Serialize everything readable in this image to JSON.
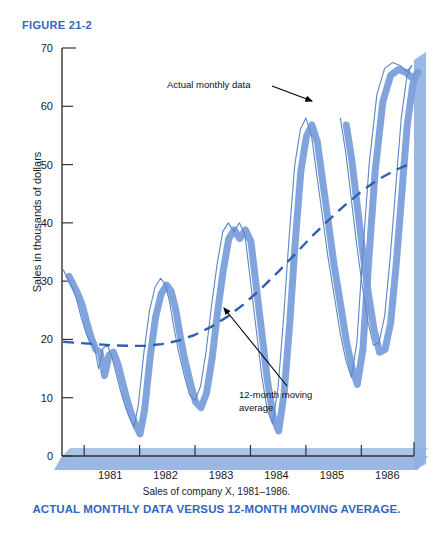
{
  "figure": {
    "label": "FIGURE 21-2"
  },
  "caption": {
    "source_note": "Sales of company X, 1981–1986.",
    "title": "ACTUAL MONTHLY DATA VERSUS 12-MONTH MOVING AVERAGE."
  },
  "colors": {
    "accent_blue": "#2f68c0",
    "shadow_blue": "#7b9fdb",
    "line_blue": "#5a86c8",
    "axis": "#333333"
  },
  "chart_data": {
    "type": "line",
    "title": "ACTUAL MONTHLY DATA VERSUS 12-MONTH MOVING AVERAGE.",
    "subtitle": "Sales of company X, 1981–1986.",
    "xlabel": "",
    "ylabel": "Sales in thousands of dollars",
    "ylim": [
      0,
      70
    ],
    "yticks": [
      0,
      10,
      20,
      30,
      40,
      50,
      60,
      70
    ],
    "xlim": [
      1980.6,
      1986.95
    ],
    "xticks": [
      1981,
      1982,
      1983,
      1984,
      1985,
      1986
    ],
    "xtick_labels": [
      "1981",
      "1982",
      "1983",
      "1984",
      "1985",
      "1986"
    ],
    "grid": false,
    "legend": "none",
    "annotations": [
      {
        "text": "Actual monthly data",
        "target_series": "actual_monthly_data"
      },
      {
        "text": "12-month moving average",
        "target_series": "moving_average_12mo"
      }
    ],
    "series": [
      {
        "name": "actual_monthly_data",
        "label": "Actual monthly data",
        "style": "solid-thin-with-shadow",
        "x": [
          1980.62,
          1980.7,
          1980.78,
          1980.86,
          1980.94,
          1981.02,
          1981.1,
          1981.18,
          1981.26,
          1981.34,
          1981.42,
          1981.5,
          1981.58,
          1981.66,
          1981.74,
          1981.82,
          1981.9,
          1981.98,
          1982.08,
          1982.18,
          1982.28,
          1982.38,
          1982.46,
          1982.54,
          1982.62,
          1982.7,
          1982.8,
          1982.9,
          1983.0,
          1983.1,
          1983.2,
          1983.3,
          1983.4,
          1983.5,
          1983.6,
          1983.7,
          1983.8,
          1983.9,
          1984.0,
          1984.1,
          1984.2,
          1984.3,
          1984.4,
          1984.5,
          1984.6,
          1984.7,
          1984.8,
          1984.9,
          1985.0,
          1985.1,
          1985.2,
          1985.3,
          1985.4,
          1985.52,
          1985.62,
          1985.72,
          1985.82,
          1985.92,
          1986.02,
          1986.14,
          1986.28,
          1986.42,
          1986.56,
          1986.7,
          1986.82,
          1986.92
        ],
        "y": [
          32.0,
          30.5,
          29.0,
          27.0,
          24.0,
          21.5,
          19.5,
          19.0,
          15.0,
          18.5,
          19.0,
          17.0,
          14.0,
          11.0,
          8.5,
          6.5,
          5.0,
          9.0,
          18.0,
          25.0,
          29.0,
          30.5,
          29.5,
          26.5,
          22.0,
          18.0,
          14.0,
          10.5,
          9.5,
          12.0,
          18.0,
          26.0,
          33.0,
          38.5,
          40.0,
          38.5,
          40.0,
          38.0,
          30.0,
          22.0,
          14.0,
          8.0,
          5.5,
          12.0,
          24.0,
          38.0,
          50.0,
          56.0,
          58.0,
          55.0,
          48.0,
          41.0,
          34.0,
          27.0,
          21.0,
          16.5,
          13.5,
          19.5,
          34.0,
          50.0,
          62.0,
          66.5,
          67.5,
          67.0,
          66.0,
          67.0
        ]
      },
      {
        "name": "actual_monthly_data_tail",
        "label": "Actual monthly data (1985-86 cycle)",
        "style": "solid-thin-with-shadow",
        "x": [
          1985.62,
          1985.72,
          1985.82,
          1985.92,
          1986.02,
          1986.12,
          1986.22,
          1986.32,
          1986.42,
          1986.52,
          1986.62,
          1986.72,
          1986.82,
          1986.9
        ],
        "y": [
          58.0,
          52.0,
          44.0,
          36.0,
          29.0,
          23.0,
          19.0,
          19.5,
          24.0,
          34.0,
          46.0,
          58.0,
          65.0,
          67.0
        ]
      },
      {
        "name": "moving_average_12mo",
        "label": "12-month moving average",
        "style": "dashed",
        "x": [
          1980.62,
          1980.9,
          1981.2,
          1981.5,
          1981.8,
          1982.1,
          1982.4,
          1982.7,
          1983.0,
          1983.3,
          1983.6,
          1983.9,
          1984.2,
          1984.5,
          1984.8,
          1985.1,
          1985.4,
          1985.7,
          1986.0,
          1986.3,
          1986.6,
          1986.9
        ],
        "y": [
          19.6,
          19.4,
          19.2,
          19.0,
          18.9,
          18.9,
          19.2,
          19.8,
          20.8,
          22.2,
          24.0,
          26.2,
          28.8,
          31.6,
          34.6,
          37.6,
          40.4,
          43.0,
          45.4,
          47.4,
          49.0,
          50.2
        ]
      }
    ]
  }
}
